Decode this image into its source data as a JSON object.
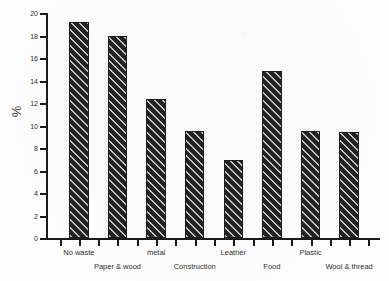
{
  "chart_data": {
    "type": "bar",
    "title": "",
    "subtitle": "",
    "xlabel": "",
    "ylabel": "%",
    "ylim": [
      0,
      20
    ],
    "ytick_step": 2,
    "yticks": [
      0,
      2,
      4,
      6,
      8,
      10,
      12,
      14,
      16,
      18,
      20
    ],
    "ytick_labels": [
      "0",
      "2",
      "4",
      "6",
      "8",
      "10",
      "12",
      "14",
      "16",
      "18",
      "20"
    ],
    "grid": false,
    "legend": false,
    "legend_position": "none",
    "categories": [
      "No waste",
      "Paper & wood",
      "metal",
      "Construction",
      "Leather",
      "Food",
      "Plastic",
      "Wool & thread"
    ],
    "values": [
      19.3,
      18.0,
      12.4,
      9.55,
      7.0,
      14.9,
      9.55,
      9.5
    ],
    "series": [
      {
        "name": "",
        "values": [
          19.3,
          18.0,
          12.4,
          9.55,
          7.0,
          14.9,
          9.55,
          9.5
        ]
      }
    ],
    "bar_fill": "#232323",
    "bar_pattern": "diagonal-hatch",
    "label_rows": [
      "top",
      "bottom",
      "top",
      "bottom",
      "top",
      "bottom",
      "top",
      "bottom"
    ],
    "axis_color": "#1a1a1a",
    "background": "#fdfdfd"
  }
}
